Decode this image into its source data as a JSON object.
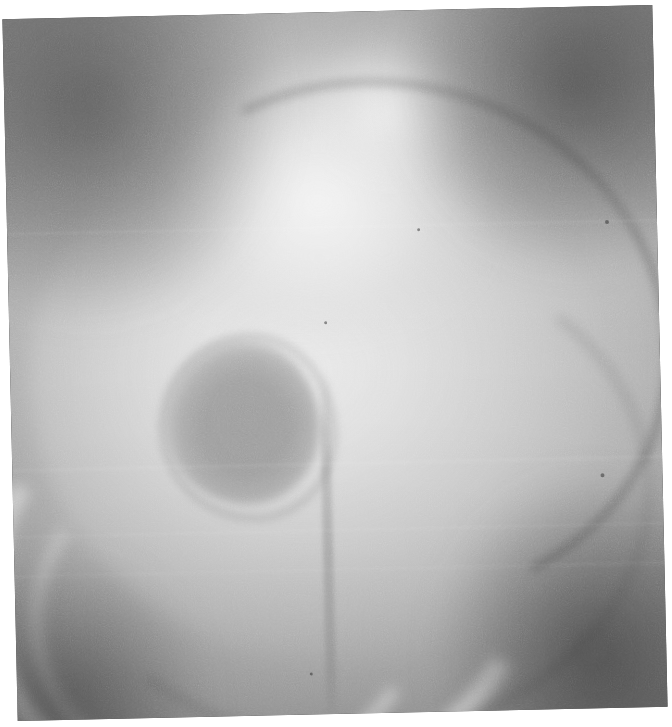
{
  "image": {
    "kind": "radiograph-photograph",
    "modality_label": "grayscale radiograph",
    "alt": "Grayscale radiographic image (cystogram) showing a contrast-filled bladder with a large rounded filling defect in the left lower portion of the bladder lumen",
    "width_px": 672,
    "height_px": 727,
    "rotation_deg": -1.25,
    "border": {
      "color": "#ffffff",
      "left_px": 10,
      "top_px": 12,
      "right_px": 12,
      "bottom_px": 13
    }
  },
  "palette": {
    "paper_white": "#ffffff",
    "film_brightest": "#f6f6f6",
    "contrast_field": "#cdcdcd",
    "midtone": "#9a9a9a",
    "lesion_gray": "#989898",
    "soft_tissue": "#7d7d7d",
    "vignette_dark": "#3a3a3a",
    "corner_darkest": "#2d2d2d"
  },
  "features": [
    {
      "id": "organ",
      "name": "contrast-filled-bladder",
      "description": "Large bright rounded contrast-filled organ occupying the central field",
      "center_pct": [
        49,
        54
      ],
      "size_pct": [
        92,
        76
      ],
      "tone": "#d8d8d8"
    },
    {
      "id": "dome",
      "name": "superior-contrast-dome",
      "description": "Bright dome of contrast along the superior margin",
      "center_pct": [
        49,
        26
      ],
      "size_pct": [
        50,
        40
      ],
      "tone": "#f0f0f0"
    },
    {
      "id": "lesion",
      "name": "rounded-filling-defect",
      "description": "Well circumscribed rounded intraluminal filling defect, left of midline, lower half",
      "center_pct": [
        35.5,
        58
      ],
      "size_pct": [
        24,
        23.5
      ],
      "tone": "#989898"
    },
    {
      "id": "bone-arc",
      "name": "pubic-ramus-arc",
      "description": "Bright curvilinear bony arc sweeping through the lower left quadrant",
      "tone": "#f3f3f3"
    },
    {
      "id": "contour-right",
      "name": "right-soft-tissue-contour",
      "description": "Darker curved soft-tissue contour line descending along the right flank",
      "tone": "#565656"
    },
    {
      "id": "contour-bottom",
      "name": "inferior-margin-contour",
      "description": "Darker curved line marking the inferior margin of the bright field",
      "tone": "#606060"
    },
    {
      "id": "midline",
      "name": "midline-vertical-structure",
      "description": "Faint vertical linear density at the inferior midline",
      "tone": "#707070"
    },
    {
      "id": "vignette",
      "name": "corner-vignette",
      "description": "Dark collimation / vignetted corners surrounding the exposed field",
      "tone": "#3a3a3a"
    }
  ],
  "specks": [
    {
      "name": "print-speck",
      "x_pct": 63.0,
      "y_pct": 31.0,
      "d_px": 3
    },
    {
      "name": "print-speck",
      "x_pct": 92.0,
      "y_pct": 30.5,
      "d_px": 4
    },
    {
      "name": "print-speck",
      "x_pct": 48.5,
      "y_pct": 44.0,
      "d_px": 3
    },
    {
      "name": "print-speck",
      "x_pct": 90.5,
      "y_pct": 66.5,
      "d_px": 4
    },
    {
      "name": "print-speck",
      "x_pct": 45.0,
      "y_pct": 94.0,
      "d_px": 3
    }
  ],
  "bands": [
    {
      "name": "horizontal-fold-band",
      "y_pct": 30.6
    },
    {
      "name": "horizontal-fold-band",
      "y_pct": 64.3
    },
    {
      "name": "horizontal-fold-band",
      "y_pct": 73.8
    },
    {
      "name": "horizontal-fold-band",
      "y_pct": 79.4
    }
  ]
}
